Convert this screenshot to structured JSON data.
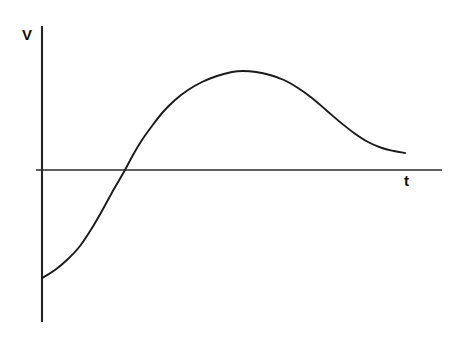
{
  "figure": {
    "background_color": "#ffffff",
    "ink_color": "#1a1a1a",
    "width": 460,
    "height": 339
  },
  "axes": {
    "y_axis": {
      "label": "V",
      "name": "voltage",
      "orientation": "vertical",
      "x_px": 42,
      "top_px": 26,
      "bottom_px": 322,
      "stroke_width": 2.1,
      "color": "#232323"
    },
    "x_axis": {
      "label": "t",
      "name": "time",
      "orientation": "horizontal",
      "y_px": 170,
      "left_px": 36,
      "right_px": 442,
      "stroke_width": 1.7,
      "color": "#2b2b2b"
    },
    "origin": {
      "x_px": 42,
      "y_px": 170
    }
  },
  "chart_data": {
    "type": "line",
    "title": "",
    "subtitle": "",
    "xlabel": "t",
    "ylabel": "V",
    "grid": false,
    "legend": null,
    "axis_style": "bare-axes-no-ticks",
    "tick_labels": {
      "x": [],
      "y": []
    },
    "xlim_px": [
      42,
      442
    ],
    "ylim_px": [
      322,
      26
    ],
    "annotations": [
      {
        "name": "start-point",
        "label": "start below axis",
        "x": 42,
        "y": 278
      },
      {
        "name": "zero-crossing",
        "label": "crosses t-axis",
        "x": 125,
        "y": 170
      },
      {
        "name": "peak",
        "label": "maximum V",
        "x": 243,
        "y": 71
      },
      {
        "name": "end-point",
        "label": "decaying tail",
        "x": 405,
        "y": 153
      }
    ],
    "series": [
      {
        "name": "voltage-curve",
        "color": "#1a1a1a",
        "stroke_width": 1.9,
        "points_px": [
          [
            42,
            278
          ],
          [
            55,
            270
          ],
          [
            68,
            259
          ],
          [
            80,
            246
          ],
          [
            92,
            228
          ],
          [
            103,
            209
          ],
          [
            114,
            189
          ],
          [
            125,
            170
          ],
          [
            133,
            155
          ],
          [
            142,
            140
          ],
          [
            152,
            126
          ],
          [
            163,
            112
          ],
          [
            175,
            100
          ],
          [
            188,
            90
          ],
          [
            202,
            82
          ],
          [
            217,
            76
          ],
          [
            232,
            72
          ],
          [
            243,
            71
          ],
          [
            256,
            72
          ],
          [
            270,
            75
          ],
          [
            284,
            80
          ],
          [
            298,
            88
          ],
          [
            312,
            98
          ],
          [
            326,
            110
          ],
          [
            340,
            122
          ],
          [
            354,
            133
          ],
          [
            368,
            142
          ],
          [
            382,
            148
          ],
          [
            394,
            151
          ],
          [
            405,
            153
          ]
        ]
      }
    ]
  }
}
